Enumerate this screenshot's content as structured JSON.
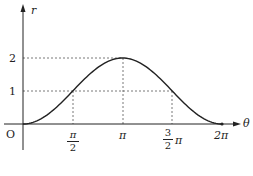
{
  "diagram": {
    "axes": {
      "x_label": "θ",
      "y_label": "r",
      "origin_label": "O"
    },
    "y_ticks": [
      {
        "value": 2,
        "label": "2"
      },
      {
        "value": 1,
        "label": "1"
      }
    ],
    "x_ticks": [
      {
        "value": "π/2",
        "num": "π",
        "den": "2"
      },
      {
        "value": "π",
        "label": "π"
      },
      {
        "value": "3π/2",
        "num": "3",
        "den": "2",
        "suffix": "π"
      },
      {
        "value": "2π",
        "label": "2π"
      }
    ],
    "curve": "r = 1 - cos θ, 0 ≤ θ ≤ 2π",
    "colors": {
      "line": "#222222",
      "guide": "#555555"
    }
  }
}
